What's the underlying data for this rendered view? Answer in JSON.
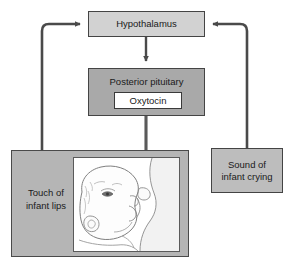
{
  "diagram": {
    "nodes": {
      "hypothalamus": {
        "label": "Hypothalamus",
        "fill": "#d2d2d2"
      },
      "posterior_pituitary": {
        "label": "Posterior pituitary",
        "fill": "#a9a9a9"
      },
      "oxytocin": {
        "label": "Oxytocin",
        "fill": "#ffffff"
      },
      "touch": {
        "label_line1": "Touch of",
        "label_line2": "infant lips",
        "fill": "#b5b5b5"
      },
      "crying": {
        "label_line1": "Sound of",
        "label_line2": "infant crying",
        "fill": "#bdbdbd"
      }
    },
    "illustration": {
      "name": "infant-nursing-illustration",
      "description": "Line drawing of an infant nursing at the breast"
    },
    "edges": [
      {
        "name": "touch-to-hypothalamus",
        "from": "Touch of infant lips",
        "to": "Hypothalamus"
      },
      {
        "name": "crying-to-hypothalamus",
        "from": "Sound of infant crying",
        "to": "Hypothalamus"
      },
      {
        "name": "hypothalamus-to-pituitary",
        "from": "Hypothalamus",
        "to": "Posterior pituitary"
      },
      {
        "name": "oxytocin-to-breast",
        "from": "Oxytocin",
        "to": "Breast"
      }
    ],
    "colors": {
      "line": "#4a4a4a",
      "text": "#1a1a1a",
      "background": "#ffffff"
    }
  }
}
